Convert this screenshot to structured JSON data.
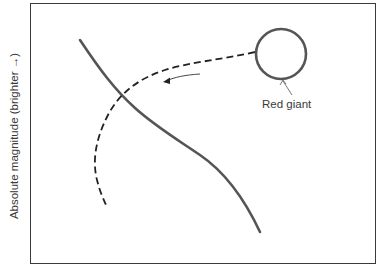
{
  "axes": {
    "ylabel": "Absolute magnitude (brighter →)"
  },
  "labels": {
    "red_giant": "Red giant"
  },
  "elements": {
    "main_sequence_curve": "solid",
    "evolution_track": "dashed",
    "direction_arrow": "leftward"
  },
  "colors": {
    "stroke": "#555555",
    "frame": "#3a3a3a",
    "background": "#ffffff"
  }
}
